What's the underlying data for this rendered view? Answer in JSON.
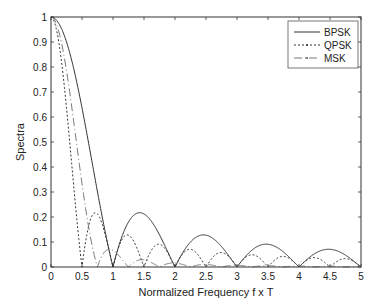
{
  "chart_data": {
    "type": "line",
    "title": "",
    "xlabel": "Normalized Frequency f x T",
    "ylabel": "Spectra",
    "xlim": [
      0,
      5
    ],
    "ylim": [
      0,
      1
    ],
    "grid": false,
    "legend_position": "upper right",
    "x_ticks": [
      0,
      0.5,
      1,
      1.5,
      2,
      2.5,
      3,
      3.5,
      4,
      4.5,
      5
    ],
    "x_tick_labels": [
      "0",
      "0.5",
      "1",
      "1.5",
      "2",
      "2.5",
      "3",
      "3.5",
      "4",
      "4.5",
      "5"
    ],
    "y_ticks": [
      0,
      0.1,
      0.2,
      0.3,
      0.4,
      0.5,
      0.6,
      0.7,
      0.8,
      0.9,
      1
    ],
    "y_tick_labels": [
      "0",
      "0.1",
      "0.2",
      "0.3",
      "0.4",
      "0.5",
      "0.6",
      "0.7",
      "0.8",
      "0.9",
      "1"
    ],
    "x": [
      0,
      0.125,
      0.25,
      0.375,
      0.5,
      0.625,
      0.75,
      0.875,
      1,
      1.125,
      1.25,
      1.375,
      1.5,
      1.625,
      1.75,
      1.875,
      2,
      2.125,
      2.25,
      2.375,
      2.5,
      2.625,
      2.75,
      2.875,
      3,
      3.125,
      3.25,
      3.375,
      3.5,
      3.625,
      3.75,
      3.875,
      4,
      4.125,
      4.25,
      4.375,
      4.5,
      4.625,
      4.75,
      4.875,
      5
    ],
    "series": [
      {
        "name": "BPSK",
        "style": "solid",
        "color": "#333333",
        "values": [
          1.0,
          0.974,
          0.9,
          0.784,
          0.637,
          0.471,
          0.3,
          0.14,
          0.0,
          0.111,
          0.18,
          0.21,
          0.212,
          0.185,
          0.129,
          0.065,
          0.0,
          0.058,
          0.1,
          0.122,
          0.127,
          0.111,
          0.082,
          0.042,
          0.0,
          0.039,
          0.069,
          0.086,
          0.091,
          0.082,
          0.06,
          0.031,
          0.0,
          0.03,
          0.053,
          0.068,
          0.071,
          0.064,
          0.047,
          0.024,
          0.0
        ]
      },
      {
        "name": "QPSK",
        "style": "dotted",
        "color": "#333333",
        "values": [
          1.0,
          0.9,
          0.637,
          0.3,
          0.0,
          0.18,
          0.212,
          0.129,
          0.0,
          0.1,
          0.127,
          0.082,
          0.0,
          0.069,
          0.091,
          0.06,
          0.0,
          0.053,
          0.071,
          0.047,
          0.0,
          0.043,
          0.058,
          0.039,
          0.0,
          0.036,
          0.049,
          0.033,
          0.0,
          0.031,
          0.042,
          0.029,
          0.0,
          0.027,
          0.037,
          0.025,
          0.0,
          0.024,
          0.033,
          0.023,
          0.0
        ]
      },
      {
        "name": "MSK",
        "style": "dashdot",
        "color": "#777777",
        "values": [
          1.0,
          0.938,
          0.786,
          0.54,
          0.343,
          0.12,
          0.0,
          0.045,
          0.067,
          0.059,
          0.031,
          0.006,
          0.0,
          0.01,
          0.023,
          0.021,
          0.012,
          0.002,
          0.0,
          0.005,
          0.011,
          0.01,
          0.006,
          0.001,
          0.0,
          0.003,
          0.006,
          0.006,
          0.004,
          0.001,
          0.0,
          0.002,
          0.004,
          0.004,
          0.002,
          0.0,
          0.0,
          0.001,
          0.002,
          0.002,
          0.001
        ]
      }
    ]
  },
  "legend": {
    "items": [
      {
        "label": "BPSK"
      },
      {
        "label": "QPSK"
      },
      {
        "label": "MSK"
      }
    ]
  },
  "axes": {
    "xlabel": "Normalized Frequency f x T",
    "ylabel": "Spectra"
  }
}
